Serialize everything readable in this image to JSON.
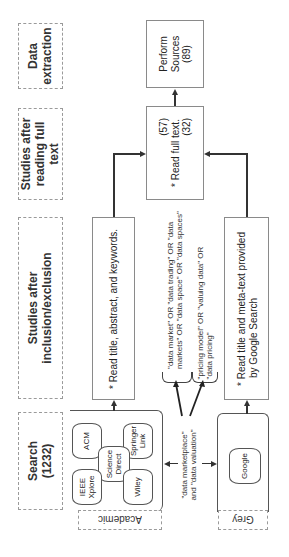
{
  "stages": [
    {
      "label": "Data extraction"
    },
    {
      "label": "Studies after reading full text"
    },
    {
      "label": "Studies after inclusion/exclusion"
    },
    {
      "label": "Search (1232)"
    }
  ],
  "boxes": {
    "perform_sources": {
      "line1": "Perform",
      "line2": "Sources",
      "line3": "(89)"
    },
    "full_text": {
      "left_count": "(57)",
      "bullet": "* Read full text.",
      "right_count": "(32)"
    },
    "academic_screen": {
      "text": "* Read title, abstract, and keywords."
    },
    "grey_screen": {
      "line1": "* Read title and meta-text provided",
      "line2": "by Google Search"
    }
  },
  "search_terms": {
    "group1": {
      "line1": "\"data market\" OR \"data trading\" OR \"data",
      "line2": "markets\" OR \"data space\" OR \"data spaces\""
    },
    "group2": {
      "line1": "\"pricing model\" OR \"valuing data\" OR",
      "line2": "\"data pricing\""
    },
    "base": {
      "line1": "\"data marketplace\"",
      "line2": "and \"data valuation\""
    }
  },
  "sources": {
    "academic": {
      "label": "Academic",
      "databases": [
        "ACM",
        "Springer Link",
        "Science Direct",
        "IEEE Xplore",
        "Wiley"
      ]
    },
    "grey": {
      "label": "Grey",
      "databases": [
        "Google"
      ]
    }
  }
}
